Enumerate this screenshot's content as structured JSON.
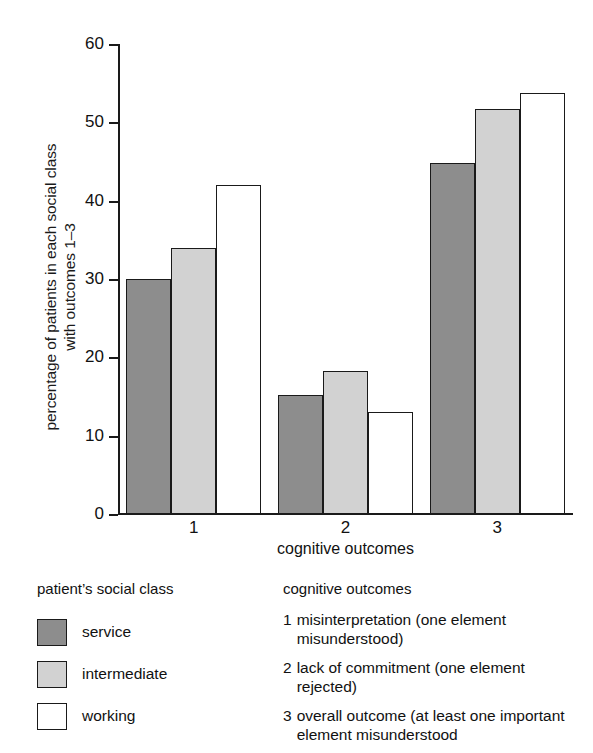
{
  "chart_data": {
    "type": "bar",
    "title": "",
    "xlabel": "cognitive outcomes",
    "ylabel": "percentage of patients in each social class\nwith outcomes 1–3",
    "categories": [
      "1",
      "2",
      "3"
    ],
    "series": [
      {
        "name": "service",
        "values": [
          30,
          15.2,
          44.8
        ],
        "color": "#8d8d8d"
      },
      {
        "name": "intermediate",
        "values": [
          34,
          18.3,
          51.7
        ],
        "color": "#d2d2d2"
      },
      {
        "name": "working",
        "values": [
          42,
          13.0,
          53.7
        ],
        "color": "#ffffff"
      }
    ],
    "ylim": [
      0,
      60
    ],
    "yticks": [
      0,
      10,
      20,
      30,
      40,
      50,
      60
    ],
    "ytick_labels": [
      "0",
      "10",
      "20",
      "30",
      "40",
      "50",
      "60"
    ],
    "grid": false,
    "legend_position": "below"
  },
  "legend_left": {
    "title": "patient’s social class",
    "items": [
      {
        "label": "service",
        "swatch": "service"
      },
      {
        "label": "intermediate",
        "swatch": "intermediate"
      },
      {
        "label": "working",
        "swatch": "working"
      }
    ]
  },
  "legend_right": {
    "title": "cognitive outcomes",
    "items": [
      {
        "number": "1",
        "description": "misinterpretation (one element misunderstood)"
      },
      {
        "number": "2",
        "description": "lack of commitment (one element rejected)"
      },
      {
        "number": "3",
        "description": "overall outcome (at least one important element misunderstood"
      }
    ]
  }
}
